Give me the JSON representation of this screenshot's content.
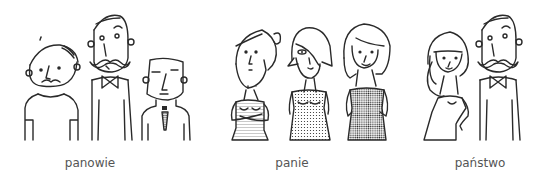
{
  "groups": [
    {
      "id": "panowie",
      "caption": "panowie",
      "figures": [
        "man-with-beret",
        "man-with-mustache-bowtie",
        "man-with-tie"
      ]
    },
    {
      "id": "panie",
      "caption": "panie",
      "figures": [
        "woman-with-bun",
        "woman-with-bob",
        "woman-with-long-hair"
      ]
    },
    {
      "id": "panstwo",
      "caption": "państwo",
      "figures": [
        "woman-long-hair",
        "man-with-mustache-bowtie"
      ]
    }
  ]
}
